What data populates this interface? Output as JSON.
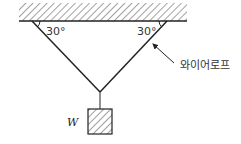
{
  "diagram": {
    "type": "statics-free-body",
    "angle_left": "30°",
    "angle_right": "30°",
    "rope_label": "와이어로프",
    "weight_label": "W",
    "colors": {
      "line": "#222222",
      "hatch": "#444444"
    }
  }
}
